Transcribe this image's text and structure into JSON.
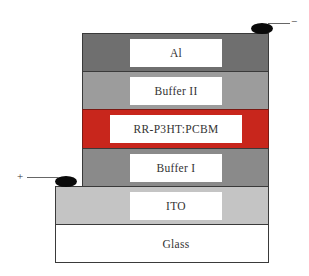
{
  "diagram": {
    "type": "device layer stack",
    "layers": [
      {
        "name": "Al",
        "color": "#6f6f6f"
      },
      {
        "name": "Buffer II",
        "color": "#9c9c9c"
      },
      {
        "name": "RR-P3HT:PCBM",
        "color": "#c8261c"
      },
      {
        "name": "Buffer I",
        "color": "#8a8a8a"
      },
      {
        "name": "ITO",
        "color": "#c4c4c4"
      },
      {
        "name": "Glass",
        "color": "#ffffff"
      }
    ],
    "contacts": {
      "top": {
        "sign": "−",
        "attached_to": "Al"
      },
      "bottom": {
        "sign": "+",
        "attached_to": "ITO"
      }
    }
  }
}
